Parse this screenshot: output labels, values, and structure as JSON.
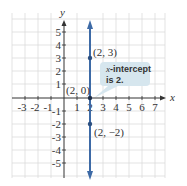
{
  "axes": {
    "x_label": "x",
    "y_label": "y",
    "x_ticks": [
      "-3",
      "-2",
      "-1",
      "1",
      "2",
      "3",
      "4",
      "5",
      "6",
      "7"
    ],
    "y_ticks": [
      "5",
      "4",
      "3",
      "2",
      "1",
      "-1",
      "-2",
      "-3",
      "-4",
      "-5"
    ]
  },
  "line": {
    "equation": "x = 2",
    "color": "#3d6aa6"
  },
  "points": [
    {
      "label": "(2, 3)",
      "x": 2,
      "y": 3
    },
    {
      "label": "(2, 0)",
      "x": 2,
      "y": 0
    },
    {
      "label": "(2, −2)",
      "x": 2,
      "y": -2
    }
  ],
  "callout": {
    "line1_italic": "x",
    "line1_rest": "-intercept",
    "line2": "is 2.",
    "color": "#d6e6ee"
  },
  "colors": {
    "grid": "#dddddd",
    "axis": "#333333"
  }
}
